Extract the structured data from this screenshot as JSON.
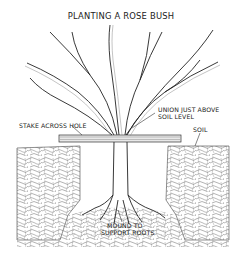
{
  "diagram": {
    "title": "PLANTING A ROSE BUSH",
    "labels": {
      "stake": "STAKE ACROSS HOLE",
      "union_line1": "UNION JUST ABOVE",
      "union_line2": "SOIL LEVEL",
      "soil": "SOIL",
      "mound_line1": "MOUND TO",
      "mound_line2": "SUPPORT ROOTS"
    },
    "colors": {
      "ink": "#222222",
      "background": "#ffffff",
      "soil_hatch": "#555555"
    }
  }
}
